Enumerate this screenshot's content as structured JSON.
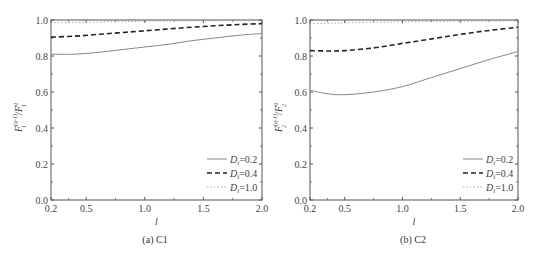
{
  "chart_data": [
    {
      "type": "line",
      "caption": "(a) C1",
      "xlabel": "l",
      "ylabel": "F1^(q-1)/F1^(q)",
      "xlim": [
        0.2,
        2.0
      ],
      "ylim": [
        0.0,
        1.0
      ],
      "xticks": [
        "0.2",
        "0.5",
        "1.0",
        "1.5",
        "2.0"
      ],
      "yticks": [
        "0.0",
        "0.2",
        "0.4",
        "0.6",
        "0.8",
        "1.0"
      ],
      "grid": false,
      "legend_position": "lower right",
      "x": [
        0.2,
        0.4,
        0.6,
        0.8,
        1.0,
        1.2,
        1.4,
        1.6,
        1.8,
        2.0
      ],
      "series": [
        {
          "name": "Di=0.2",
          "style": "solid",
          "color": "#888888",
          "values": [
            0.81,
            0.81,
            0.82,
            0.835,
            0.85,
            0.865,
            0.885,
            0.9,
            0.915,
            0.925
          ]
        },
        {
          "name": "Di=0.4",
          "style": "dashed",
          "color": "#222222",
          "values": [
            0.905,
            0.91,
            0.92,
            0.93,
            0.94,
            0.95,
            0.96,
            0.968,
            0.975,
            0.98
          ]
        },
        {
          "name": "Di=1.0",
          "style": "dotted",
          "color": "#aaaaaa",
          "values": [
            0.985,
            0.987,
            0.989,
            0.991,
            0.993,
            0.994,
            0.995,
            0.996,
            0.997,
            0.998
          ]
        }
      ]
    },
    {
      "type": "line",
      "caption": "(b) C2",
      "xlabel": "l",
      "ylabel": "F2^(q-1)/F2^(q)",
      "xlim": [
        0.2,
        2.0
      ],
      "ylim": [
        0.0,
        1.0
      ],
      "xticks": [
        "0.2",
        "0.5",
        "1.0",
        "1.5",
        "2.0"
      ],
      "yticks": [
        "0.0",
        "0.2",
        "0.4",
        "0.6",
        "0.8",
        "1.0"
      ],
      "grid": false,
      "legend_position": "lower right",
      "x": [
        0.2,
        0.35,
        0.5,
        0.75,
        1.0,
        1.25,
        1.5,
        1.75,
        2.0
      ],
      "series": [
        {
          "name": "Di=0.2",
          "style": "solid",
          "color": "#888888",
          "values": [
            0.61,
            0.59,
            0.585,
            0.6,
            0.63,
            0.68,
            0.73,
            0.78,
            0.825
          ]
        },
        {
          "name": "Di=0.4",
          "style": "dashed",
          "color": "#222222",
          "values": [
            0.83,
            0.828,
            0.83,
            0.845,
            0.87,
            0.895,
            0.92,
            0.942,
            0.96
          ]
        },
        {
          "name": "Di=1.0",
          "style": "dotted",
          "color": "#aaaaaa",
          "values": [
            0.98,
            0.982,
            0.984,
            0.987,
            0.99,
            0.992,
            0.993,
            0.994,
            0.995
          ]
        }
      ]
    }
  ],
  "legend": {
    "prefix": "D",
    "subscript": "i",
    "items": [
      "=0.2",
      "=0.4",
      "=1.0"
    ]
  },
  "panels": {
    "a": {
      "caption": "(a) C1",
      "xlabel": "l",
      "ylabel_main": "F",
      "ylabel_sub": "1",
      "ylabel_sup_num": "(q-1)",
      "ylabel_sup_den": "q"
    },
    "b": {
      "caption": "(b) C2",
      "xlabel": "l",
      "ylabel_main": "F",
      "ylabel_sub": "2",
      "ylabel_sup_num": "(q-1)",
      "ylabel_sup_den": "q"
    }
  }
}
